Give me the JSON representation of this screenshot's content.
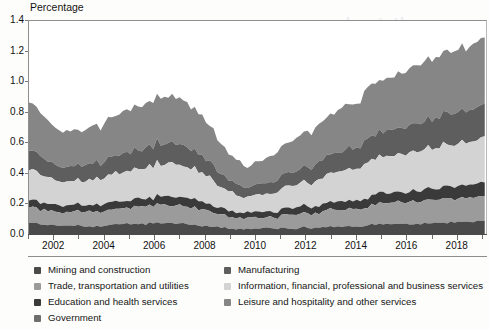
{
  "axis_title": "Percentage",
  "legend": {
    "left_items": [
      {
        "label": "Mining and construction",
        "color": "#4a4a4a"
      },
      {
        "label": "Trade, transportation and utilities",
        "color": "#9b9b9b"
      },
      {
        "label": "Education and health services",
        "color": "#3a3a3a"
      },
      {
        "label": "Government",
        "color": "#6e6e6e"
      }
    ],
    "right_items": [
      {
        "label": "Manufacturing",
        "color": "#5e5e5e"
      },
      {
        "label": "Information, financial, professional and business services",
        "color": "#d3d3d3"
      },
      {
        "label": "Leisure and hospitality and other services",
        "color": "#868686"
      }
    ]
  },
  "bleed_text": [
    {
      "text": "and",
      "x": 318,
      "y": 14,
      "size": 17
    },
    {
      "text": "not",
      "x": 355,
      "y": 14,
      "size": 17
    },
    {
      "text": "the",
      "x": 393,
      "y": 14,
      "size": 17
    },
    {
      "text": "the",
      "x": 300,
      "y": 36,
      "size": 11
    },
    {
      "text": "workers",
      "x": 330,
      "y": 36,
      "size": 11
    },
    {
      "text": "of",
      "x": 300,
      "y": 52,
      "size": 11
    },
    {
      "text": "industry",
      "x": 322,
      "y": 52,
      "size": 11
    },
    {
      "text": "workers",
      "x": 290,
      "y": 178,
      "size": 11
    }
  ],
  "chart_data": {
    "type": "area",
    "stacked": true,
    "title": "",
    "subtitle": "",
    "xlabel": "",
    "ylabel": "Percentage",
    "ylim": [
      0.0,
      1.4
    ],
    "yticks": [
      0.0,
      0.2,
      0.4,
      0.6,
      0.8,
      1.0,
      1.2,
      1.4
    ],
    "ytick_labels": [
      "0.0",
      "0.2",
      "0.4",
      "0.6",
      "0.8",
      "1.0",
      "1.2",
      "1.4"
    ],
    "xlim": [
      2001.0,
      2019.2
    ],
    "xticks": [
      2002,
      2004,
      2006,
      2008,
      2010,
      2012,
      2014,
      2016,
      2018
    ],
    "xtick_labels": [
      "2002",
      "2004",
      "2006",
      "2008",
      "2010",
      "2012",
      "2014",
      "2016",
      "2018"
    ],
    "grid": false,
    "legend_position": "bottom",
    "x": [
      2001.0,
      2001.15,
      2001.3,
      2001.45,
      2001.6,
      2001.75,
      2001.9,
      2002.05,
      2002.2,
      2002.35,
      2002.5,
      2002.65,
      2002.8,
      2002.95,
      2003.1,
      2003.25,
      2003.4,
      2003.55,
      2003.7,
      2003.85,
      2004.0,
      2004.15,
      2004.3,
      2004.45,
      2004.6,
      2004.75,
      2004.9,
      2005.05,
      2005.2,
      2005.35,
      2005.5,
      2005.65,
      2005.8,
      2005.95,
      2006.1,
      2006.25,
      2006.4,
      2006.55,
      2006.7,
      2006.85,
      2007.0,
      2007.15,
      2007.3,
      2007.45,
      2007.6,
      2007.75,
      2007.9,
      2008.05,
      2008.2,
      2008.35,
      2008.5,
      2008.65,
      2008.8,
      2008.95,
      2009.1,
      2009.25,
      2009.4,
      2009.55,
      2009.7,
      2009.85,
      2010.0,
      2010.15,
      2010.3,
      2010.45,
      2010.6,
      2010.75,
      2010.9,
      2011.05,
      2011.2,
      2011.35,
      2011.5,
      2011.65,
      2011.8,
      2011.95,
      2012.1,
      2012.25,
      2012.4,
      2012.55,
      2012.7,
      2012.85,
      2013.0,
      2013.15,
      2013.3,
      2013.45,
      2013.6,
      2013.75,
      2013.9,
      2014.05,
      2014.2,
      2014.35,
      2014.5,
      2014.65,
      2014.8,
      2014.95,
      2015.1,
      2015.25,
      2015.4,
      2015.55,
      2015.7,
      2015.85,
      2016.0,
      2016.15,
      2016.3,
      2016.45,
      2016.6,
      2016.75,
      2016.9,
      2017.05,
      2017.2,
      2017.35,
      2017.5,
      2017.65,
      2017.8,
      2017.95,
      2018.1,
      2018.25,
      2018.4,
      2018.55,
      2018.7,
      2018.85,
      2019.0,
      2019.15
    ],
    "series": [
      {
        "name": "Mining and construction",
        "color": "#4a4a4a",
        "values": [
          0.075,
          0.072,
          0.068,
          0.064,
          0.061,
          0.058,
          0.056,
          0.055,
          0.054,
          0.053,
          0.052,
          0.051,
          0.051,
          0.05,
          0.05,
          0.051,
          0.052,
          0.053,
          0.054,
          0.055,
          0.057,
          0.058,
          0.06,
          0.061,
          0.062,
          0.063,
          0.064,
          0.065,
          0.066,
          0.067,
          0.068,
          0.068,
          0.069,
          0.07,
          0.071,
          0.071,
          0.072,
          0.072,
          0.071,
          0.07,
          0.069,
          0.068,
          0.066,
          0.064,
          0.062,
          0.06,
          0.058,
          0.055,
          0.053,
          0.05,
          0.048,
          0.045,
          0.042,
          0.039,
          0.036,
          0.034,
          0.032,
          0.031,
          0.03,
          0.03,
          0.03,
          0.031,
          0.032,
          0.033,
          0.034,
          0.035,
          0.035,
          0.036,
          0.037,
          0.038,
          0.039,
          0.04,
          0.041,
          0.042,
          0.043,
          0.044,
          0.045,
          0.046,
          0.047,
          0.048,
          0.049,
          0.05,
          0.051,
          0.052,
          0.053,
          0.054,
          0.055,
          0.056,
          0.057,
          0.058,
          0.059,
          0.06,
          0.061,
          0.062,
          0.063,
          0.064,
          0.064,
          0.065,
          0.066,
          0.066,
          0.067,
          0.068,
          0.068,
          0.069,
          0.07,
          0.07,
          0.071,
          0.072,
          0.073,
          0.074,
          0.075,
          0.076,
          0.077,
          0.078,
          0.079,
          0.08,
          0.081,
          0.082,
          0.083,
          0.084,
          0.085,
          0.086
        ]
      },
      {
        "name": "Trade, transportation and utilities",
        "color": "#9b9b9b",
        "values": [
          0.105,
          0.102,
          0.099,
          0.096,
          0.094,
          0.092,
          0.091,
          0.09,
          0.089,
          0.089,
          0.089,
          0.089,
          0.089,
          0.09,
          0.091,
          0.092,
          0.093,
          0.094,
          0.095,
          0.097,
          0.098,
          0.1,
          0.101,
          0.103,
          0.104,
          0.106,
          0.107,
          0.109,
          0.11,
          0.112,
          0.113,
          0.114,
          0.115,
          0.116,
          0.117,
          0.118,
          0.119,
          0.119,
          0.119,
          0.118,
          0.117,
          0.116,
          0.114,
          0.112,
          0.11,
          0.107,
          0.104,
          0.101,
          0.098,
          0.094,
          0.09,
          0.086,
          0.082,
          0.078,
          0.074,
          0.071,
          0.069,
          0.067,
          0.066,
          0.066,
          0.067,
          0.068,
          0.07,
          0.072,
          0.074,
          0.076,
          0.078,
          0.08,
          0.082,
          0.084,
          0.086,
          0.088,
          0.09,
          0.092,
          0.094,
          0.096,
          0.098,
          0.1,
          0.102,
          0.104,
          0.106,
          0.108,
          0.11,
          0.112,
          0.114,
          0.116,
          0.118,
          0.12,
          0.122,
          0.124,
          0.126,
          0.128,
          0.13,
          0.132,
          0.134,
          0.136,
          0.137,
          0.139,
          0.14,
          0.141,
          0.142,
          0.143,
          0.144,
          0.145,
          0.146,
          0.147,
          0.148,
          0.149,
          0.15,
          0.151,
          0.152,
          0.153,
          0.154,
          0.155,
          0.156,
          0.157,
          0.158,
          0.159,
          0.16,
          0.161,
          0.162,
          0.163
        ]
      },
      {
        "name": "Education and health services",
        "color": "#3a3a3a",
        "values": [
          0.048,
          0.047,
          0.046,
          0.045,
          0.044,
          0.044,
          0.043,
          0.043,
          0.043,
          0.043,
          0.043,
          0.043,
          0.043,
          0.044,
          0.044,
          0.045,
          0.045,
          0.046,
          0.046,
          0.047,
          0.047,
          0.048,
          0.048,
          0.049,
          0.049,
          0.05,
          0.05,
          0.051,
          0.051,
          0.052,
          0.052,
          0.053,
          0.053,
          0.054,
          0.054,
          0.055,
          0.055,
          0.055,
          0.055,
          0.055,
          0.054,
          0.054,
          0.053,
          0.053,
          0.052,
          0.051,
          0.05,
          0.049,
          0.048,
          0.047,
          0.046,
          0.044,
          0.043,
          0.041,
          0.04,
          0.039,
          0.038,
          0.037,
          0.037,
          0.037,
          0.037,
          0.038,
          0.038,
          0.039,
          0.04,
          0.04,
          0.041,
          0.042,
          0.042,
          0.043,
          0.044,
          0.045,
          0.045,
          0.046,
          0.047,
          0.048,
          0.049,
          0.049,
          0.05,
          0.051,
          0.052,
          0.053,
          0.054,
          0.055,
          0.055,
          0.056,
          0.057,
          0.058,
          0.059,
          0.06,
          0.061,
          0.062,
          0.062,
          0.063,
          0.064,
          0.065,
          0.066,
          0.067,
          0.067,
          0.068,
          0.069,
          0.07,
          0.071,
          0.072,
          0.072,
          0.073,
          0.074,
          0.075,
          0.076,
          0.077,
          0.078,
          0.079,
          0.08,
          0.081,
          0.082,
          0.083,
          0.084,
          0.085,
          0.086,
          0.087,
          0.088,
          0.089
        ]
      },
      {
        "name": "Information, financial, professional and business services",
        "color": "#d3d3d3",
        "values": [
          0.205,
          0.198,
          0.19,
          0.183,
          0.177,
          0.172,
          0.168,
          0.165,
          0.163,
          0.161,
          0.16,
          0.159,
          0.159,
          0.16,
          0.161,
          0.163,
          0.165,
          0.167,
          0.17,
          0.172,
          0.175,
          0.178,
          0.181,
          0.184,
          0.187,
          0.19,
          0.193,
          0.196,
          0.199,
          0.202,
          0.204,
          0.207,
          0.209,
          0.211,
          0.213,
          0.214,
          0.215,
          0.215,
          0.214,
          0.213,
          0.211,
          0.208,
          0.204,
          0.2,
          0.195,
          0.189,
          0.183,
          0.176,
          0.169,
          0.161,
          0.153,
          0.145,
          0.137,
          0.129,
          0.122,
          0.116,
          0.111,
          0.108,
          0.106,
          0.106,
          0.107,
          0.11,
          0.113,
          0.117,
          0.121,
          0.125,
          0.129,
          0.133,
          0.137,
          0.141,
          0.145,
          0.149,
          0.153,
          0.157,
          0.161,
          0.165,
          0.169,
          0.173,
          0.177,
          0.181,
          0.185,
          0.189,
          0.193,
          0.197,
          0.201,
          0.205,
          0.209,
          0.213,
          0.217,
          0.221,
          0.225,
          0.229,
          0.232,
          0.236,
          0.239,
          0.242,
          0.245,
          0.248,
          0.25,
          0.253,
          0.255,
          0.257,
          0.259,
          0.261,
          0.263,
          0.265,
          0.267,
          0.269,
          0.271,
          0.273,
          0.275,
          0.277,
          0.279,
          0.281,
          0.283,
          0.285,
          0.287,
          0.289,
          0.291,
          0.293,
          0.295,
          0.297
        ]
      },
      {
        "name": "Manufacturing",
        "color": "#5e5e5e",
        "values": [
          0.13,
          0.125,
          0.12,
          0.115,
          0.111,
          0.107,
          0.104,
          0.102,
          0.1,
          0.099,
          0.098,
          0.097,
          0.097,
          0.098,
          0.099,
          0.1,
          0.102,
          0.103,
          0.105,
          0.107,
          0.109,
          0.111,
          0.113,
          0.115,
          0.117,
          0.119,
          0.121,
          0.123,
          0.125,
          0.127,
          0.129,
          0.13,
          0.132,
          0.133,
          0.134,
          0.135,
          0.136,
          0.136,
          0.135,
          0.134,
          0.133,
          0.131,
          0.129,
          0.126,
          0.123,
          0.119,
          0.115,
          0.111,
          0.106,
          0.101,
          0.096,
          0.09,
          0.085,
          0.079,
          0.074,
          0.07,
          0.067,
          0.065,
          0.064,
          0.064,
          0.065,
          0.067,
          0.069,
          0.072,
          0.075,
          0.078,
          0.081,
          0.084,
          0.087,
          0.09,
          0.093,
          0.096,
          0.099,
          0.102,
          0.105,
          0.108,
          0.111,
          0.114,
          0.117,
          0.12,
          0.123,
          0.126,
          0.129,
          0.132,
          0.135,
          0.138,
          0.141,
          0.144,
          0.147,
          0.15,
          0.153,
          0.156,
          0.158,
          0.161,
          0.163,
          0.166,
          0.168,
          0.17,
          0.172,
          0.174,
          0.176,
          0.178,
          0.18,
          0.182,
          0.184,
          0.186,
          0.188,
          0.19,
          0.192,
          0.194,
          0.196,
          0.198,
          0.2,
          0.202,
          0.204,
          0.206,
          0.208,
          0.21,
          0.212,
          0.214,
          0.216,
          0.218
        ]
      },
      {
        "name": "Leisure and hospitality and other services",
        "color": "#868686",
        "values": [
          0.325,
          0.31,
          0.296,
          0.283,
          0.271,
          0.261,
          0.252,
          0.245,
          0.24,
          0.236,
          0.233,
          0.231,
          0.23,
          0.231,
          0.233,
          0.235,
          0.238,
          0.241,
          0.245,
          0.248,
          0.252,
          0.256,
          0.26,
          0.264,
          0.268,
          0.272,
          0.276,
          0.28,
          0.284,
          0.287,
          0.291,
          0.294,
          0.297,
          0.299,
          0.301,
          0.302,
          0.303,
          0.302,
          0.301,
          0.299,
          0.296,
          0.292,
          0.287,
          0.281,
          0.274,
          0.266,
          0.257,
          0.247,
          0.237,
          0.226,
          0.214,
          0.202,
          0.19,
          0.178,
          0.167,
          0.158,
          0.151,
          0.146,
          0.144,
          0.144,
          0.146,
          0.15,
          0.155,
          0.16,
          0.166,
          0.172,
          0.178,
          0.184,
          0.19,
          0.196,
          0.202,
          0.208,
          0.214,
          0.22,
          0.226,
          0.232,
          0.238,
          0.244,
          0.25,
          0.256,
          0.262,
          0.268,
          0.274,
          0.28,
          0.286,
          0.292,
          0.298,
          0.304,
          0.31,
          0.316,
          0.322,
          0.327,
          0.332,
          0.337,
          0.342,
          0.346,
          0.35,
          0.354,
          0.358,
          0.362,
          0.365,
          0.369,
          0.372,
          0.376,
          0.379,
          0.382,
          0.386,
          0.389,
          0.392,
          0.396,
          0.399,
          0.402,
          0.406,
          0.409,
          0.413,
          0.416,
          0.42,
          0.423,
          0.427,
          0.43,
          0.434,
          0.437
        ]
      }
    ],
    "noise_amplitude": 0.022
  }
}
